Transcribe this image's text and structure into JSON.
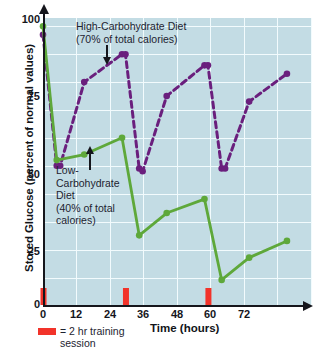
{
  "chart_data": {
    "type": "line",
    "title": "",
    "xlabel": "Time (hours)",
    "ylabel": "Stored Glucose (percent of normal values)",
    "xlim": [
      0,
      78
    ],
    "ylim": [
      0,
      103
    ],
    "xticks": [
      "0",
      "12",
      "24",
      "36",
      "48",
      "60",
      "72"
    ],
    "yticks": [
      "0",
      "25",
      "50",
      "75",
      "100"
    ],
    "grid": "white gridlines, vertical every 12 hours, horizontal every 10 percent",
    "legend_position": "inline annotations on plot",
    "series": [
      {
        "name": "High-Carbohydrate Diet (70% of total calories)",
        "style": "dashed",
        "color": "#6a1f7d",
        "x": [
          0,
          4,
          5,
          12,
          23,
          24,
          28,
          29,
          36,
          47,
          48,
          52,
          53,
          60,
          71
        ],
        "y": [
          97,
          50,
          50,
          80,
          90,
          90,
          49,
          48,
          75,
          86,
          86,
          49,
          49,
          73,
          83
        ]
      },
      {
        "name": "Low-Carbohydrate Diet (40% of total calories)",
        "style": "solid",
        "color": "#5ea83a",
        "x": [
          0,
          4,
          12,
          23,
          28,
          36,
          47,
          52,
          60,
          71
        ],
        "y": [
          100,
          52,
          54,
          60,
          25,
          33,
          38,
          9,
          17,
          23
        ]
      }
    ],
    "training_sessions": {
      "label": "= 2 hr training session",
      "color": "#f2332a",
      "x": [
        0,
        24,
        48
      ],
      "duration_hours": 2
    },
    "annotations": [
      {
        "id": "high-carb",
        "lines": [
          "High-Carbohydrate Diet",
          "(70% of total calories)"
        ],
        "points_to_x": 21,
        "points_to_y": 92
      },
      {
        "id": "low-carb",
        "lines": [
          "Low-",
          "Carbohydrate",
          "Diet",
          "(40% of total",
          "calories)"
        ],
        "points_to_x": 13,
        "points_to_y": 56
      }
    ]
  },
  "axes": {
    "y_title": "Stored Glucose (percent of normal values)",
    "x_title": "Time (hours)",
    "y_tick_labels": [
      "100",
      "75",
      "50",
      "25",
      "0"
    ],
    "x_tick_labels": [
      "0",
      "12",
      "24",
      "36",
      "48",
      "60",
      "72"
    ]
  },
  "annotations": {
    "high_carb_line1": "High-Carbohydrate Diet",
    "high_carb_line2": "(70% of total calories)",
    "low_carb_line1": "Low-",
    "low_carb_line2": "Carbohydrate",
    "low_carb_line3": "Diet",
    "low_carb_line4": "(40% of total",
    "low_carb_line5": "calories)"
  },
  "legend": {
    "training_line1": "= 2 hr training",
    "training_line2": "session"
  },
  "colors": {
    "plot_background": "#c3dce4",
    "gridline": "#f2fbfd",
    "high_carb": "#6a1f7d",
    "low_carb": "#5ea83a",
    "training_bar": "#f2332a",
    "axis": "#15161c"
  }
}
